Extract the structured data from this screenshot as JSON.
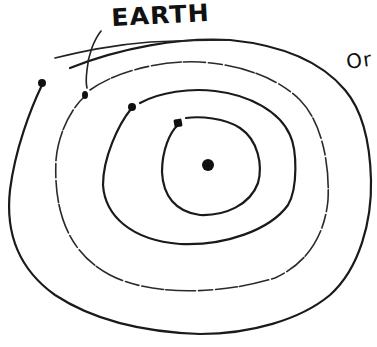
{
  "diagram": {
    "type": "hand-drawn solar system orbits",
    "labels": {
      "earth": "EARTH",
      "right_cutoff": "Or"
    },
    "colors": {
      "ink": "#1a1a1a",
      "background": "#ffffff"
    },
    "sun": {
      "cx": 208,
      "cy": 165,
      "r": 6
    },
    "orbits": [
      {
        "name": "orbit-1",
        "planet": {
          "cx": 178,
          "cy": 123
        }
      },
      {
        "name": "orbit-2",
        "planet": {
          "cx": 132,
          "cy": 107
        }
      },
      {
        "name": "orbit-3-earth",
        "planet": {
          "cx": 85,
          "cy": 95
        }
      },
      {
        "name": "orbit-4",
        "planet": {
          "cx": 42,
          "cy": 83
        }
      }
    ]
  }
}
